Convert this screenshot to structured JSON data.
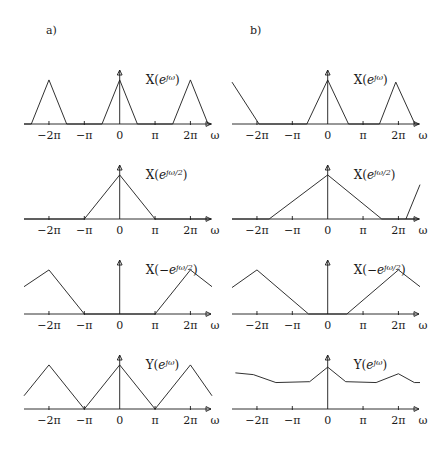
{
  "figure": {
    "background": "#ffffff",
    "stroke_color": "#1a1a1a",
    "panels": [
      {
        "id": "a",
        "label": "a)"
      },
      {
        "id": "b",
        "label": "b)"
      }
    ],
    "axis": {
      "xlabel": "ω",
      "tick_labels": [
        "−2π",
        "−π",
        "0",
        "π",
        "2π"
      ],
      "tick_values": [
        -6.2832,
        -3.1416,
        0,
        3.1416,
        6.2832
      ],
      "xlim": [
        -8.5,
        8.2
      ],
      "ylim": [
        0,
        1.18
      ],
      "grid": false
    }
  },
  "chart_data": [
    {
      "id": "a1",
      "panel": "a",
      "row": 1,
      "type": "line",
      "title": "X(e^{jω})",
      "title_parts": {
        "base": "X(",
        "e": "e",
        "exp": "jω",
        "close": ")"
      },
      "xlabel": "ω",
      "ylabel": "",
      "xlim": [
        -8.5,
        8.2
      ],
      "ylim": [
        0,
        1.18
      ],
      "xticks": [
        -6.2832,
        -3.1416,
        0,
        3.1416,
        6.2832
      ],
      "xticklabels": [
        "−2π",
        "−π",
        "0",
        "π",
        "2π"
      ],
      "description": "Periodic narrow triangles centered at 0 and ±2π, half-width 0.5π, peak 1",
      "x": [
        -8.5,
        -7.85,
        -6.2832,
        -4.71,
        -1.5708,
        0,
        1.5708,
        4.71,
        6.2832,
        7.85,
        8.2
      ],
      "y": [
        0,
        0,
        1,
        0,
        0,
        1,
        0,
        0,
        1,
        0,
        0
      ]
    },
    {
      "id": "a2",
      "panel": "a",
      "row": 2,
      "type": "line",
      "title": "X(e^{jω/2})",
      "title_parts": {
        "base": "X(",
        "e": "e",
        "exp": "jω/2",
        "close": ")"
      },
      "xlabel": "ω",
      "ylabel": "",
      "xlim": [
        -8.5,
        8.2
      ],
      "ylim": [
        0,
        1.18
      ],
      "xticks": [
        -6.2832,
        -3.1416,
        0,
        3.1416,
        6.2832
      ],
      "xticklabels": [
        "−2π",
        "−π",
        "0",
        "π",
        "2π"
      ],
      "description": "Single wide triangle from −π to π peaking at 0",
      "x": [
        -8.5,
        -3.1416,
        0,
        3.1416,
        8.2
      ],
      "y": [
        0,
        0,
        1,
        0,
        0
      ]
    },
    {
      "id": "a3",
      "panel": "a",
      "row": 3,
      "type": "line",
      "title": "X(−e^{jω/2})",
      "title_parts": {
        "base": "X(−",
        "e": "e",
        "exp": "jω/2",
        "close": ")"
      },
      "xlabel": "ω",
      "ylabel": "",
      "xlim": [
        -8.5,
        8.2
      ],
      "ylim": [
        0,
        1.18
      ],
      "xticks": [
        -6.2832,
        -3.1416,
        0,
        3.1416,
        6.2832
      ],
      "xticklabels": [
        "−2π",
        "−π",
        "0",
        "π",
        "2π"
      ],
      "description": "Triangles peaking at ±2π, zero between −π and π, truncated at plot edges",
      "x": [
        -8.5,
        -6.2832,
        -3.1416,
        3.1416,
        6.2832,
        8.2
      ],
      "y": [
        0.62,
        1,
        0,
        0,
        1,
        0.62
      ]
    },
    {
      "id": "a4",
      "panel": "a",
      "row": 4,
      "type": "line",
      "title": "Y(e^{jω})",
      "title_parts": {
        "base": "Y(",
        "e": "e",
        "exp": "jω",
        "close": ")"
      },
      "xlabel": "ω",
      "ylabel": "",
      "xlim": [
        -8.5,
        8.2
      ],
      "ylim": [
        0,
        1.18
      ],
      "xticks": [
        -6.2832,
        -3.1416,
        0,
        3.1416,
        6.2832
      ],
      "xticklabels": [
        "−2π",
        "−π",
        "0",
        "π",
        "2π"
      ],
      "description": "Continuous triangular wave: peaks at 0 and ±2π, zeros at ±π",
      "x": [
        -8.5,
        -6.2832,
        -3.1416,
        0,
        3.1416,
        6.2832,
        8.2
      ],
      "y": [
        0.3,
        1,
        0,
        1,
        0,
        1,
        0.3
      ]
    },
    {
      "id": "b1",
      "panel": "b",
      "row": 1,
      "type": "line",
      "title": "X(e^{jω})",
      "title_parts": {
        "base": "X(",
        "e": "e",
        "exp": "jω",
        "close": ")"
      },
      "xlabel": "ω",
      "ylabel": "",
      "xlim": [
        -8.5,
        8.2
      ],
      "ylim": [
        0,
        1.18
      ],
      "xticks": [
        -6.2832,
        -3.1416,
        0,
        3.1416,
        6.2832
      ],
      "xticklabels": [
        "−2π",
        "−π",
        "0",
        "π",
        "2π"
      ],
      "description": "Truncated falling edge at left, triangle at 0 (half-width ~1.2π), triangle peaking just before 2π",
      "x": [
        -8.5,
        -6.1,
        -1.85,
        0,
        1.85,
        4.6,
        6.05,
        7.75,
        8.2
      ],
      "y": [
        0.95,
        0,
        0,
        1,
        0,
        0,
        0.95,
        0,
        0
      ]
    },
    {
      "id": "b2",
      "panel": "b",
      "row": 2,
      "type": "line",
      "title": "X(e^{jω/2})",
      "title_parts": {
        "base": "X(",
        "e": "e",
        "exp": "jω/2",
        "close": ")"
      },
      "xlabel": "ω",
      "ylabel": "",
      "xlim": [
        -8.5,
        8.2
      ],
      "ylim": [
        0,
        1.18
      ],
      "xticks": [
        -6.2832,
        -3.1416,
        0,
        3.1416,
        6.2832
      ],
      "xticklabels": [
        "−2π",
        "−π",
        "0",
        "π",
        "2π"
      ],
      "description": "Wide triangle from −5.2 to 4.8 peaking at 0, plus rising segment starting near 7.0",
      "segments": [
        {
          "x": [
            -8.5,
            -5.2,
            0,
            4.8,
            8.2
          ],
          "y": [
            0,
            0,
            1,
            0,
            0
          ]
        },
        {
          "x": [
            6.95,
            8.2
          ],
          "y": [
            0,
            0.78
          ]
        }
      ]
    },
    {
      "id": "b3",
      "panel": "b",
      "row": 3,
      "type": "line",
      "title": "X(−e^{jω/2})",
      "title_parts": {
        "base": "X(−",
        "e": "e",
        "exp": "jω/2",
        "close": ")"
      },
      "xlabel": "ω",
      "ylabel": "",
      "xlim": [
        -8.5,
        8.2
      ],
      "ylim": [
        0,
        1.18
      ],
      "xticks": [
        -6.2832,
        -3.1416,
        0,
        3.1416,
        6.2832
      ],
      "xticklabels": [
        "−2π",
        "−π",
        "0",
        "π",
        "2π"
      ],
      "description": "Triangles peaking at ±2π with flat zero band between −1.7 and 1.7",
      "x": [
        -8.5,
        -6.2832,
        -1.7,
        1.7,
        6.2832,
        8.2
      ],
      "y": [
        0.6,
        1,
        0,
        0,
        1,
        0.62
      ]
    },
    {
      "id": "b4",
      "panel": "b",
      "row": 4,
      "type": "line",
      "title": "Y(e^{jω})",
      "title_parts": {
        "base": "Y(",
        "e": "e",
        "exp": "jω",
        "close": ")"
      },
      "xlabel": "ω",
      "ylabel": "",
      "xlim": [
        -8.5,
        8.2
      ],
      "ylim": [
        0,
        1.18
      ],
      "xticks": [
        -6.2832,
        -3.1416,
        0,
        3.1416,
        6.2832
      ],
      "xticklabels": [
        "−2π",
        "−π",
        "0",
        "π",
        "2π"
      ],
      "description": "Curve elevated above axis: sharp peak at 0, plateaus, secondary bump near 2π",
      "x": [
        -8.2,
        -6.6,
        -4.6,
        -1.6,
        0,
        1.6,
        4.3,
        6.2832,
        7.7,
        8.2
      ],
      "y": [
        0.82,
        0.78,
        0.6,
        0.62,
        0.95,
        0.62,
        0.6,
        0.8,
        0.6,
        0.6
      ]
    }
  ]
}
